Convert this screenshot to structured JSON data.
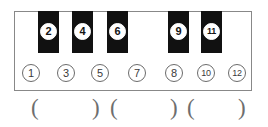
{
  "diagram": {
    "name": "piano-keyboard-octave-chart",
    "colors": {
      "white_key": "#ffffff",
      "black_key": "#111111",
      "outline": "#888888",
      "number_text_white_key": "#3a3a3a",
      "number_text_black_key": "#141414",
      "paren": "#6e6e6e"
    },
    "white_keys": [
      {
        "label": "1",
        "type": "white",
        "x": 14,
        "width": 35
      },
      {
        "label": "3",
        "type": "white",
        "x": 49,
        "width": 34
      },
      {
        "label": "5",
        "type": "white",
        "x": 83,
        "width": 34
      },
      {
        "label": "7",
        "type": "white",
        "x": 117,
        "width": 40
      },
      {
        "label": "8",
        "type": "white",
        "x": 157,
        "width": 34
      },
      {
        "label": "10",
        "type": "white",
        "x": 191,
        "width": 31
      },
      {
        "label": "12",
        "type": "white",
        "x": 222,
        "width": 30
      }
    ],
    "black_keys": [
      {
        "label": "2",
        "type": "black",
        "x": 38,
        "width": 21
      },
      {
        "label": "4",
        "type": "black",
        "x": 72,
        "width": 21
      },
      {
        "label": "6",
        "type": "black",
        "x": 107,
        "width": 21
      },
      {
        "label": "9",
        "type": "black",
        "x": 168,
        "width": 21
      },
      {
        "label": "11",
        "type": "black",
        "x": 201,
        "width": 21
      }
    ],
    "brackets": [
      {
        "open": "(",
        "close": ")",
        "open_x": 31,
        "close_x": 92
      },
      {
        "open": "(",
        "close": ")",
        "open_x": 110,
        "close_x": 170
      },
      {
        "open": "(",
        "close": ")",
        "open_x": 187,
        "close_x": 238
      }
    ]
  }
}
